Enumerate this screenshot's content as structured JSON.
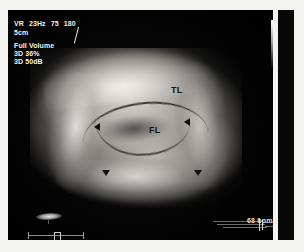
{
  "modality": {
    "header_params": [
      "VR",
      "23Hz",
      "75",
      "180"
    ],
    "depth": "5cm",
    "volume_mode": "Full Volume",
    "render_gain": "3D 36%",
    "render_dynamic_range": "3D 50dB"
  },
  "annotations": [
    {
      "label": "TL",
      "name": "true-lumen-label"
    },
    {
      "label": "FL",
      "name": "false-lumen-label"
    }
  ],
  "measurements": {
    "heart_rate": "68 bpm"
  },
  "icons": {
    "probe": "transducer-orientation-icon",
    "scale": "depth-scale-ruler",
    "caliper": "caliper-marker",
    "ecg": "ecg-trace",
    "grayscale": "grayscale-reference-bar"
  },
  "colors": {
    "background": "#f3f3f1",
    "scan_background": "#050505",
    "overlay_text": "#f2f2f2",
    "annotation_text": "#141414"
  }
}
